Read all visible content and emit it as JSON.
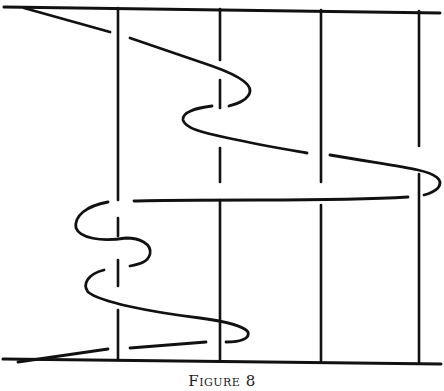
{
  "figure": {
    "caption": "Figure 8",
    "ink_color": "#111111",
    "background_color": "#ffffff"
  }
}
